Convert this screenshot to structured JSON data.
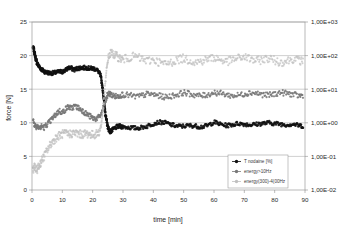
{
  "chart_data": {
    "type": "scatter",
    "title": "",
    "xlabel": "time [min]",
    "ylabel": "force [N]",
    "ylabel_right": "",
    "xlim": [
      0,
      90
    ],
    "ylim": [
      0,
      25
    ],
    "xticks": [
      0,
      10,
      20,
      30,
      40,
      50,
      60,
      70,
      80,
      90
    ],
    "xtick_labels": [
      "0",
      "10",
      "20",
      "30",
      "40",
      "50",
      "60",
      "70",
      "80",
      "90"
    ],
    "yticks": [
      0,
      5,
      10,
      15,
      20,
      25
    ],
    "ytick_labels": [
      "0",
      "5",
      "10",
      "15",
      "20",
      "25"
    ],
    "right_axis": {
      "type": "log",
      "ticks": [
        1000,
        100,
        10,
        1,
        0.1,
        0.01
      ],
      "tick_labels": [
        "1,00E+03",
        "1,00E+02",
        "1,00E+01",
        "1,00E+00",
        "1,00E-01",
        "1,00E-02"
      ]
    },
    "grid": true,
    "grid_axis": "y",
    "legend_position": "bottom-right",
    "colors": {
      "t_nodaine": "#111111",
      "energy_10hz": "#787878",
      "energy_300_400hz": "#c0c0c0",
      "grid": "#a8a8a8",
      "frame": "#9a9a9a",
      "text": "#2a2a2a"
    },
    "series": [
      {
        "name": "T nodaine [%]",
        "color": "#111111",
        "axis": "left",
        "marker": "circle",
        "x": [
          0.3,
          0.6,
          0.9,
          1.2,
          1.6,
          2.0,
          2.5,
          3.0,
          3.6,
          4.2,
          5.0,
          6.0,
          7.0,
          8.0,
          9.0,
          10.0,
          11.0,
          12.0,
          13.0,
          14.0,
          15.0,
          16.0,
          17.0,
          18.0,
          19.0,
          20.0,
          21.0,
          22.0,
          22.6,
          23.0,
          23.4,
          23.8,
          24.2,
          24.6,
          25.0,
          25.4,
          25.8,
          26.2,
          27.0,
          28.0,
          29.0,
          30.0,
          32.0,
          34.0,
          36.0,
          38.0,
          40.0,
          42.0,
          44.0,
          46.0,
          48.0,
          50.0,
          52.0,
          54.0,
          56.0,
          58.0,
          60.0,
          62.0,
          64.0,
          66.0,
          68.0,
          70.0,
          72.0,
          74.0,
          76.0,
          78.0,
          80.0,
          82.0,
          84.0,
          86.0,
          88.0,
          89.5
        ],
        "y": [
          21.2,
          20.9,
          20.3,
          19.6,
          19.0,
          18.6,
          18.3,
          18.0,
          17.8,
          17.6,
          17.5,
          17.4,
          17.4,
          17.5,
          17.6,
          17.6,
          17.8,
          18.2,
          18.1,
          17.9,
          18.1,
          18.2,
          18.2,
          18.2,
          18.1,
          18.1,
          18.0,
          17.6,
          17.0,
          16.0,
          14.6,
          13.0,
          11.4,
          10.2,
          9.4,
          8.9,
          8.7,
          8.8,
          9.1,
          9.4,
          9.5,
          9.4,
          9.3,
          9.2,
          9.3,
          9.5,
          9.9,
          10.1,
          10.0,
          9.7,
          9.5,
          9.5,
          9.6,
          9.5,
          9.4,
          9.6,
          10.1,
          9.8,
          9.6,
          9.7,
          9.9,
          9.8,
          9.7,
          9.8,
          9.9,
          10.0,
          9.9,
          9.8,
          9.7,
          9.8,
          9.6,
          9.5
        ]
      },
      {
        "name": "energy>10Hz",
        "color": "#787878",
        "axis": "right",
        "marker": "circle",
        "x": [
          0.3,
          0.8,
          1.4,
          2.0,
          2.6,
          3.2,
          4.0,
          5.0,
          6.0,
          7.0,
          8.0,
          9.0,
          10.0,
          11.0,
          12.0,
          13.0,
          14.0,
          15.0,
          16.0,
          17.0,
          18.0,
          19.0,
          20.0,
          21.0,
          22.0,
          23.0,
          23.6,
          24.2,
          24.8,
          25.4,
          26.0,
          27.0,
          28.0,
          29.0,
          30.0,
          32.0,
          34.0,
          36.0,
          38.0,
          40.0,
          42.0,
          44.0,
          46.0,
          48.0,
          50.0,
          52.0,
          54.0,
          56.0,
          58.0,
          60.0,
          62.0,
          64.0,
          66.0,
          68.0,
          70.0,
          72.0,
          74.0,
          76.0,
          78.0,
          80.0,
          82.0,
          84.0,
          86.0,
          88.0,
          89.5
        ],
        "y": [
          10.4,
          9.8,
          9.4,
          9.6,
          9.2,
          9.5,
          9.3,
          9.8,
          10.2,
          10.8,
          11.3,
          11.8,
          11.5,
          12.0,
          12.4,
          12.1,
          12.5,
          12.3,
          12.0,
          11.7,
          11.3,
          11.0,
          10.7,
          10.6,
          10.8,
          11.4,
          12.3,
          13.2,
          14.0,
          14.4,
          14.2,
          14.0,
          13.9,
          14.1,
          14.2,
          14.1,
          13.9,
          14.0,
          14.3,
          14.2,
          14.0,
          13.8,
          14.0,
          14.2,
          14.5,
          14.3,
          14.1,
          14.0,
          14.2,
          14.5,
          14.4,
          14.2,
          14.0,
          14.1,
          14.3,
          14.5,
          14.4,
          14.2,
          14.1,
          14.3,
          14.5,
          14.4,
          14.2,
          14.0,
          14.1
        ]
      },
      {
        "name": "energy(300)-4(00Hz",
        "color": "#c0c0c0",
        "axis": "right",
        "marker": "circle",
        "x": [
          0.3,
          0.8,
          1.4,
          2.0,
          2.6,
          3.2,
          4.0,
          5.0,
          6.0,
          7.0,
          8.0,
          9.0,
          10.0,
          11.0,
          12.0,
          13.0,
          14.0,
          15.0,
          16.0,
          17.0,
          18.0,
          19.0,
          20.0,
          21.0,
          22.0,
          22.8,
          23.4,
          24.0,
          24.6,
          25.2,
          26.0,
          27.0,
          28.0,
          29.0,
          30.0,
          32.0,
          34.0,
          36.0,
          38.0,
          40.0,
          42.0,
          44.0,
          46.0,
          48.0,
          50.0,
          52.0,
          54.0,
          56.0,
          58.0,
          60.0,
          62.0,
          64.0,
          66.0,
          68.0,
          70.0,
          72.0,
          74.0,
          76.0,
          78.0,
          80.0,
          82.0,
          84.0,
          86.0,
          88.0,
          89.5
        ],
        "y": [
          3.1,
          3.4,
          2.9,
          3.3,
          3.8,
          4.4,
          5.0,
          5.9,
          6.7,
          7.3,
          7.8,
          8.1,
          8.3,
          8.4,
          8.3,
          8.4,
          8.5,
          8.4,
          8.3,
          8.3,
          8.4,
          8.3,
          8.2,
          8.3,
          8.5,
          9.5,
          12.0,
          15.0,
          18.0,
          19.8,
          20.4,
          20.2,
          19.9,
          19.6,
          19.4,
          19.7,
          19.9,
          19.5,
          19.2,
          19.4,
          19.0,
          18.7,
          19.0,
          19.4,
          19.6,
          19.3,
          19.0,
          19.2,
          19.5,
          19.7,
          19.4,
          19.1,
          19.3,
          19.6,
          19.8,
          19.5,
          19.2,
          19.4,
          19.6,
          19.3,
          19.0,
          19.2,
          19.5,
          19.3,
          19.1
        ]
      }
    ],
    "legend": [
      {
        "label": "T nodaine [%]",
        "color": "#111111"
      },
      {
        "label": "energy>10Hz",
        "color": "#787878"
      },
      {
        "label": "energy(300)-4(00Hz",
        "color": "#c0c0c0"
      }
    ]
  }
}
